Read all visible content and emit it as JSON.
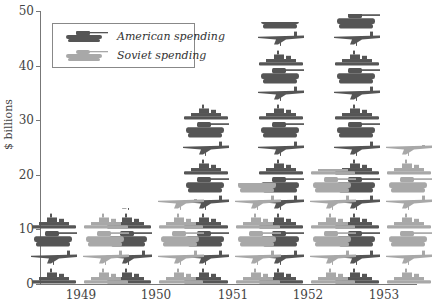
{
  "chart_data": {
    "type": "bar",
    "subtype": "pictogram",
    "title": "",
    "xlabel": "",
    "ylabel": "$ billions",
    "ylim": [
      0,
      50
    ],
    "yticks": [
      0,
      10,
      20,
      30,
      40,
      50
    ],
    "categories": [
      "1949",
      "1950",
      "1951",
      "1952",
      "1953"
    ],
    "series": [
      {
        "name": "American spending",
        "color": "#555555",
        "values": [
          13,
          14,
          33.5,
          48,
          49.5
        ]
      },
      {
        "name": "Soviet spending",
        "color": "#a8a8a8",
        "values": [
          13,
          15.5,
          18.5,
          21,
          25.5
        ]
      }
    ],
    "icon_cycle": [
      "ship",
      "plane",
      "tank"
    ],
    "legend_position": "upper-left",
    "grid": false
  },
  "legend": {
    "american": "American spending",
    "soviet": "Soviet spending"
  },
  "axis": {
    "ylabel": "$ billions",
    "ticks": [
      "0",
      "10",
      "20",
      "30",
      "40",
      "50"
    ],
    "years": [
      "1949",
      "1950",
      "1951",
      "1952",
      "1953"
    ]
  }
}
